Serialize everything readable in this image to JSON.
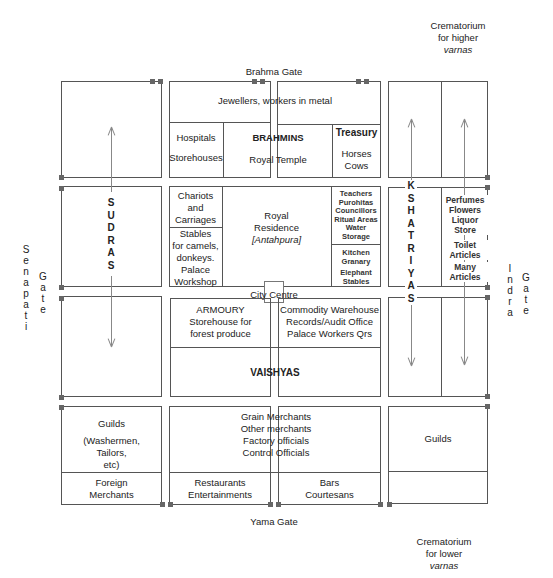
{
  "labels": {
    "crematorium_higher": [
      "Crematorium",
      "for higher",
      "varnas"
    ],
    "crematorium_lower": [
      "Crematorium",
      "for lower",
      "varnas"
    ],
    "brahma_gate": "Brahma Gate",
    "yama_gate": "Yama Gate",
    "senapati_gate": [
      "S",
      "e",
      "n",
      "a",
      "p",
      "a",
      "t",
      "i"
    ],
    "senapati_gate_word": [
      "G",
      "a",
      "t",
      "e"
    ],
    "indra_gate": [
      "I",
      "n",
      "d",
      "r",
      "a"
    ],
    "indra_gate_word": [
      "G",
      "a",
      "t",
      "e"
    ],
    "city_centre": "City Centre"
  },
  "north": {
    "jewellers": "Jewellers, workers in metal",
    "hospitals": "Hospitals",
    "storehouses": "Storehouses",
    "brahmins": "BRAHMINS",
    "royal_temple": "Royal Temple",
    "treasury": "Treasury",
    "horses": "Horses",
    "cows": "Cows"
  },
  "middle": {
    "chariots": [
      "Chariots",
      "and",
      "Carriages"
    ],
    "stables": [
      "Stables",
      "for camels,",
      "donkeys.",
      "Palace",
      "Workshop"
    ],
    "royal_residence": [
      "Royal",
      "Residence"
    ],
    "antahpura": "[Antahpura]",
    "officials": [
      "Teachers",
      "Purohitas",
      "Councillors",
      "Ritual Areas",
      "Water",
      "Storage"
    ],
    "kitchen": [
      "Kitchen",
      "Granary"
    ],
    "elephant": [
      "Elephant",
      "Stables"
    ]
  },
  "south_centre": {
    "armoury": "ARMOURY",
    "storehouse_forest": [
      "Storehouse for",
      "forest produce"
    ],
    "commodity": [
      "Commodity Warehouse",
      "Records/Audit Office",
      "Palace Workers Qrs"
    ],
    "vaishyas": "VAISHYAS"
  },
  "bottom": {
    "guilds_left": "Guilds",
    "guilds_left_detail": [
      "(Washermen,",
      "Tailors,",
      "etc)"
    ],
    "foreign": [
      "Foreign",
      "Merchants"
    ],
    "merchants": [
      "Grain Merchants",
      "Other merchants",
      "Factory officials",
      "Control Officials"
    ],
    "restaurants": [
      "Restaurants",
      "Entertainments"
    ],
    "bars": [
      "Bars",
      "Courtesans"
    ],
    "guilds_right": "Guilds"
  },
  "west": {
    "sudras": [
      "S",
      "U",
      "D",
      "R",
      "A",
      "S"
    ]
  },
  "east": {
    "kshatriyas": [
      "K",
      "S",
      "H",
      "A",
      "T",
      "R",
      "I",
      "Y",
      "A",
      "S"
    ],
    "perfumes": [
      "Perfumes",
      "Flowers",
      "Liquor",
      "Store"
    ],
    "toilet": [
      "Toilet",
      "Articles"
    ],
    "many": [
      "Many",
      "Articles"
    ]
  }
}
